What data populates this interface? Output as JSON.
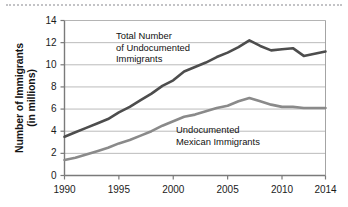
{
  "figure": {
    "name": "undocumented-immigrants-line-chart",
    "background": "#ffffff",
    "top_rule_color": "#b9b9bd"
  },
  "chart_data": {
    "type": "line",
    "title": "",
    "xlabel": "",
    "ylabel": "Number of Immigrants (in millions)",
    "ylabel_lines": [
      "Number of Immigrants",
      "(in millions)"
    ],
    "xlim": [
      1990,
      2014
    ],
    "ylim": [
      0,
      14
    ],
    "y_ticks": [
      0,
      2,
      4,
      6,
      8,
      10,
      12,
      14
    ],
    "y_tick_labels": [
      "0",
      "2",
      "4",
      "6",
      "8",
      "10",
      "12",
      "14"
    ],
    "x_ticks": [
      1990,
      1995,
      2000,
      2005,
      2010,
      2014
    ],
    "x_tick_labels": [
      "1990",
      "1995",
      "2000",
      "2005",
      "2010",
      "2014"
    ],
    "grid": true,
    "grid_axis": "y",
    "grid_color": "#b3b3b3",
    "legend": "inline-annotations",
    "legend_position": "inside-plot",
    "series": [
      {
        "name": "Total Number of Undocumented Immigrants",
        "label_lines": [
          "Total Number",
          "of Undocumented",
          "Immigrants"
        ],
        "color": "#4d4d4d",
        "line_width": 2.6,
        "x": [
          1990,
          1991,
          1992,
          1993,
          1994,
          1995,
          1996,
          1997,
          1998,
          1999,
          2000,
          2001,
          2002,
          2003,
          2004,
          2005,
          2006,
          2007,
          2008,
          2009,
          2010,
          2011,
          2012,
          2013,
          2014
        ],
        "values": [
          3.5,
          3.9,
          4.3,
          4.7,
          5.1,
          5.7,
          6.2,
          6.8,
          7.4,
          8.1,
          8.6,
          9.4,
          9.8,
          10.2,
          10.7,
          11.1,
          11.6,
          12.2,
          11.7,
          11.3,
          11.4,
          11.5,
          10.8,
          11.0,
          11.2
        ]
      },
      {
        "name": "Undocumented Mexican Immigrants",
        "label_lines": [
          "Undocumented",
          "Mexican Immigrants"
        ],
        "color": "#8a8a8a",
        "line_width": 2.6,
        "x": [
          1990,
          1991,
          1992,
          1993,
          1994,
          1995,
          1996,
          1997,
          1998,
          1999,
          2000,
          2001,
          2002,
          2003,
          2004,
          2005,
          2006,
          2007,
          2008,
          2009,
          2010,
          2011,
          2012,
          2013,
          2014
        ],
        "values": [
          1.4,
          1.6,
          1.9,
          2.2,
          2.5,
          2.9,
          3.2,
          3.6,
          4.0,
          4.5,
          4.9,
          5.3,
          5.5,
          5.8,
          6.1,
          6.3,
          6.7,
          7.0,
          6.7,
          6.4,
          6.2,
          6.2,
          6.1,
          6.1,
          6.1
        ]
      }
    ]
  }
}
